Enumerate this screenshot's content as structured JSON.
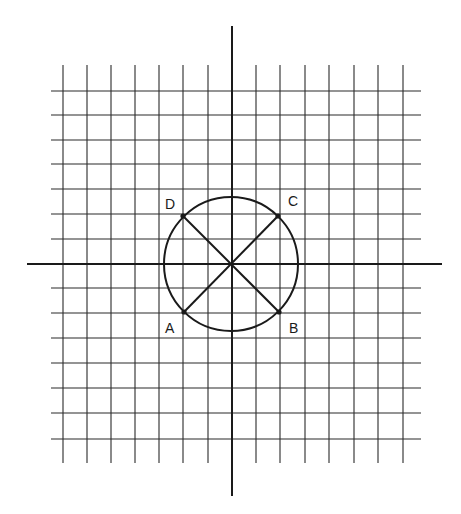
{
  "diagram": {
    "type": "coordinate-grid-with-circle",
    "colors": {
      "background": "#ffffff",
      "ink": "#1a1a1a",
      "grid": "#2a2a2a"
    },
    "grid": {
      "vertical_lines_x": [
        63,
        87,
        111,
        135,
        159,
        183,
        208,
        256,
        280,
        305,
        329,
        354,
        378,
        403
      ],
      "horizontal_lines_y": [
        91,
        115,
        140,
        164,
        189,
        214,
        239,
        288,
        313,
        338,
        363,
        388,
        413,
        439
      ],
      "vertical_line_span": [
        65,
        463
      ],
      "horizontal_line_span": [
        51,
        421
      ]
    },
    "axes": {
      "x_axis": {
        "y": 264,
        "x1": 27,
        "x2": 442
      },
      "y_axis": {
        "x": 232,
        "y1": 26,
        "y2": 496
      }
    },
    "circle": {
      "cx": 231,
      "cy": 264,
      "r": 67
    },
    "points": [
      {
        "label": "A",
        "x": 184,
        "y": 312,
        "label_x": 165,
        "label_y": 321
      },
      {
        "label": "B",
        "x": 279,
        "y": 312,
        "label_x": 289,
        "label_y": 321
      },
      {
        "label": "C",
        "x": 278,
        "y": 216,
        "label_x": 288,
        "label_y": 194
      },
      {
        "label": "D",
        "x": 183,
        "y": 216,
        "label_x": 165,
        "label_y": 197
      }
    ],
    "diameters": [
      {
        "from": "A",
        "to": "C"
      },
      {
        "from": "D",
        "to": "B"
      }
    ]
  }
}
